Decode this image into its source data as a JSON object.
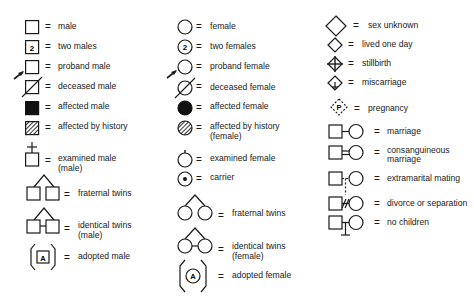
{
  "legend": {
    "column1": [
      {
        "symbol": "male",
        "label": "male"
      },
      {
        "symbol": "two-males",
        "label": "two males",
        "marker": "2"
      },
      {
        "symbol": "proband-male",
        "label": "proband male"
      },
      {
        "symbol": "deceased-male",
        "label": "deceased male"
      },
      {
        "symbol": "affected-male",
        "label": "affected male"
      },
      {
        "symbol": "affected-by-history-male",
        "label": "affected by history"
      },
      {
        "symbol": "examined-male",
        "label": "examined male",
        "label2": "(male)"
      },
      {
        "symbol": "fraternal-twins-male",
        "label": "fraternal twins"
      },
      {
        "symbol": "identical-twins-male",
        "label": "identical twins",
        "label2": "(male)"
      },
      {
        "symbol": "adopted-male",
        "label": "adopted male",
        "marker": "A"
      }
    ],
    "column2": [
      {
        "symbol": "female",
        "label": "female"
      },
      {
        "symbol": "two-females",
        "label": "two females",
        "marker": "2"
      },
      {
        "symbol": "proband-female",
        "label": "proband female"
      },
      {
        "symbol": "deceased-female",
        "label": "deceased female"
      },
      {
        "symbol": "affected-female",
        "label": "affected female"
      },
      {
        "symbol": "affected-by-history-female",
        "label": "affected by history",
        "label2": "(female)"
      },
      {
        "symbol": "examined-female",
        "label": "examined female"
      },
      {
        "symbol": "carrier",
        "label": "carrier"
      },
      {
        "symbol": "fraternal-twins-female",
        "label": "fraternal twins"
      },
      {
        "symbol": "identical-twins-female",
        "label": "identical twins",
        "label2": "(female)"
      },
      {
        "symbol": "adopted-female",
        "label": "adopted female",
        "marker": "A"
      }
    ],
    "column3": [
      {
        "symbol": "sex-unknown",
        "label": "sex unknown"
      },
      {
        "symbol": "lived-one-day",
        "label": "lived one day"
      },
      {
        "symbol": "stillbirth",
        "label": "stillbirth"
      },
      {
        "symbol": "miscarriage",
        "label": "miscarriage"
      },
      {
        "symbol": "pregnancy",
        "label": "pregnancy",
        "marker": "P"
      },
      {
        "symbol": "marriage",
        "label": "marriage"
      },
      {
        "symbol": "consanguineous-marriage",
        "label": "consanguineous",
        "label2": "marriage"
      },
      {
        "symbol": "extramarital-mating",
        "label": "extramarital mating"
      },
      {
        "symbol": "divorce-or-separation",
        "label": "divorce or separation"
      },
      {
        "symbol": "no-children",
        "label": "no children"
      }
    ],
    "equals": "="
  }
}
